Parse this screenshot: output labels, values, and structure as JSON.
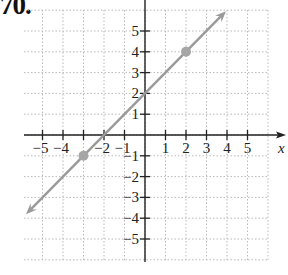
{
  "problem_number": "70.",
  "colors": {
    "grid": "#b9b9b9",
    "axis": "#222222",
    "line": "#9a9a9a",
    "point": "#a6a6a6"
  },
  "chart_data": {
    "type": "line",
    "title": "",
    "xlabel": "x",
    "ylabel": "y",
    "xlim": [
      -6,
      6
    ],
    "ylim": [
      -6,
      6
    ],
    "grid": true,
    "x_ticks": [
      -5,
      -4,
      -3,
      -2,
      -1,
      1,
      2,
      3,
      4,
      5
    ],
    "x_tick_labels": [
      "−5",
      "−4",
      "",
      "−2",
      "−1",
      "1",
      "2",
      "3",
      "4",
      "5"
    ],
    "y_ticks": [
      -5,
      -4,
      -3,
      -2,
      -1,
      1,
      2,
      3,
      4,
      5
    ],
    "y_tick_labels": [
      "−5",
      "−4",
      "−3",
      "−2",
      "−1",
      "1",
      "2",
      "3",
      "4",
      "5"
    ],
    "series": [
      {
        "name": "line",
        "equation": "y = x + 2",
        "slope": 1,
        "intercept": 2,
        "x": [
          -6,
          4
        ],
        "y": [
          -4,
          6
        ],
        "arrows": "both"
      }
    ],
    "points": [
      {
        "x": -3,
        "y": -1
      },
      {
        "x": 2,
        "y": 4
      }
    ]
  }
}
